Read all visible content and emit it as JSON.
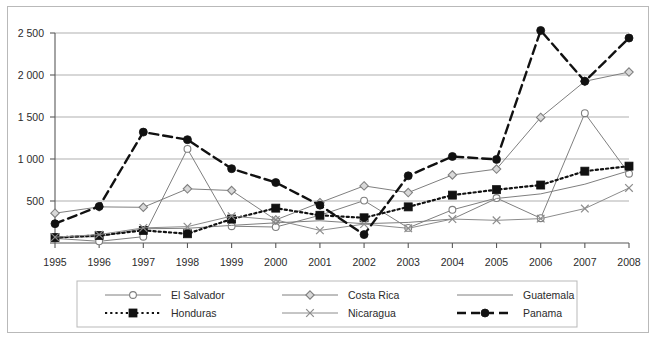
{
  "chart_data": {
    "type": "line",
    "title": "",
    "xlabel": "",
    "ylabel": "",
    "x": [
      "1995",
      "1996",
      "1997",
      "1998",
      "1999",
      "2000",
      "2001",
      "2002",
      "2003",
      "2004",
      "2005",
      "2006",
      "2007",
      "2008"
    ],
    "categories": [
      "1995",
      "1996",
      "1997",
      "1998",
      "1999",
      "2000",
      "2001",
      "2002",
      "2003",
      "2004",
      "2005",
      "2006",
      "2007",
      "2008"
    ],
    "ylim": [
      0,
      2500
    ],
    "yticks": [
      0,
      500,
      1000,
      1500,
      2000,
      2500
    ],
    "ytick_labels": [
      "",
      "500",
      "1 000",
      "1 500",
      "2 000",
      "2 500"
    ],
    "grid": true,
    "legend_position": "bottom",
    "series": [
      {
        "name": "El Salvador",
        "marker": "open-circle",
        "dash": "solid",
        "color": "#7f7f7f",
        "values": [
          55,
          20,
          75,
          1120,
          200,
          190,
          330,
          505,
          180,
          395,
          535,
          295,
          1545,
          825
        ]
      },
      {
        "name": "Costa Rica",
        "marker": "open-diamond",
        "dash": "solid",
        "color": "#7f7f7f",
        "values": [
          355,
          430,
          425,
          645,
          625,
          275,
          480,
          680,
          600,
          810,
          880,
          1495,
          1925,
          2035
        ]
      },
      {
        "name": "Guatemala",
        "marker": "none",
        "dash": "solid",
        "color": "#7f7f7f",
        "values": [
          65,
          75,
          170,
          175,
          210,
          240,
          265,
          230,
          245,
          285,
          530,
          585,
          700,
          860
        ]
      },
      {
        "name": "Honduras",
        "marker": "filled-square",
        "dash": "dotted",
        "color": "#111111",
        "values": [
          65,
          90,
          150,
          110,
          285,
          415,
          330,
          300,
          430,
          570,
          635,
          690,
          855,
          915
        ]
      },
      {
        "name": "Nicaragua",
        "marker": "x",
        "dash": "solid",
        "color": "#8c8c8c",
        "values": [
          70,
          100,
          180,
          195,
          320,
          275,
          150,
          225,
          175,
          285,
          270,
          290,
          410,
          655
        ]
      },
      {
        "name": "Panama",
        "marker": "filled-circle",
        "dash": "dashed",
        "color": "#111111",
        "values": [
          230,
          435,
          1320,
          1230,
          885,
          720,
          450,
          100,
          800,
          1030,
          995,
          2530,
          1925,
          2440
        ]
      }
    ]
  },
  "legend": {
    "entries": [
      {
        "label": "El Salvador"
      },
      {
        "label": "Costa Rica"
      },
      {
        "label": "Guatemala"
      },
      {
        "label": "Honduras"
      },
      {
        "label": "Nicaragua"
      },
      {
        "label": "Panama"
      }
    ]
  }
}
